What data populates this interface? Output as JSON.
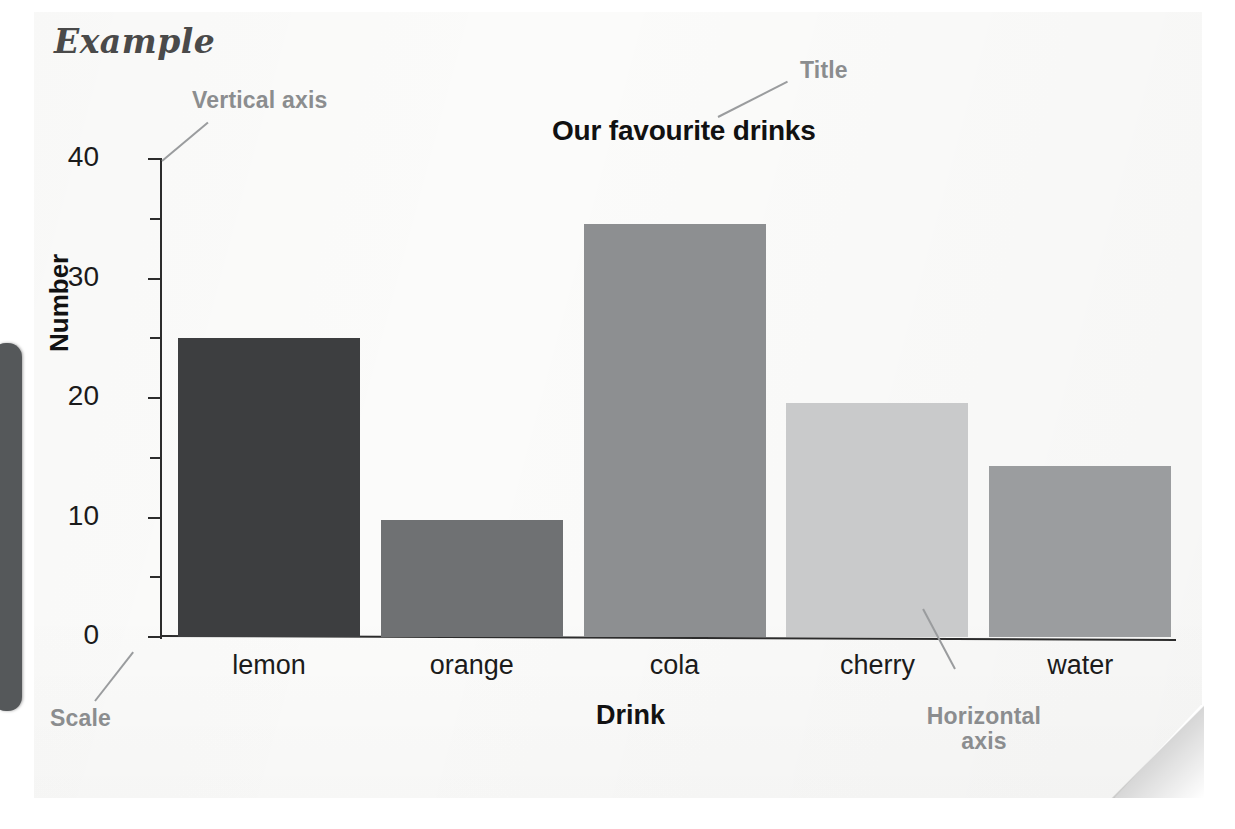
{
  "heading": "Example",
  "chart_data": {
    "type": "bar",
    "title": "Our favourite drinks",
    "xlabel": "Drink",
    "ylabel": "Number",
    "categories": [
      "lemon",
      "orange",
      "cola",
      "cherry",
      "water"
    ],
    "values": [
      25,
      9.8,
      34.6,
      19.6,
      14.3
    ],
    "bar_colors": [
      "#3d3e40",
      "#6f7173",
      "#8d8f91",
      "#c9cacb",
      "#9b9d9f"
    ],
    "ylim": [
      0,
      42
    ],
    "yticks": [
      0,
      10,
      20,
      30,
      40
    ],
    "ytick_labels": [
      "0",
      "10",
      "20",
      "30",
      "40"
    ],
    "yticks_minor": [
      5,
      15,
      25,
      35
    ],
    "grid": false,
    "legend": false
  },
  "annotations": {
    "vertical_axis": "Vertical axis",
    "title": "Title",
    "scale": "Scale",
    "horizontal_axis_line1": "Horizontal",
    "horizontal_axis_line2": "axis"
  },
  "colors": {
    "annotation": "#8b8d8f",
    "axis": "#2c2c2c",
    "text": "#1b1b1b",
    "page": "#fbfbfa",
    "side_tab": "#55585a"
  }
}
